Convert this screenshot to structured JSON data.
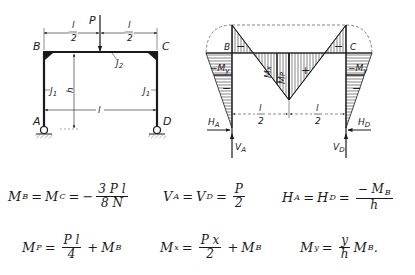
{
  "frame": {
    "labels": {
      "load": "P",
      "corner_left": "B",
      "corner_right": "C",
      "support_left": "A",
      "support_right": "D",
      "half_span_num": "l",
      "half_span_den": "2",
      "beam_inertia": "J",
      "beam_inertia_sub": "2",
      "column_inertia": "J",
      "column_inertia_sub": "1",
      "height": "h",
      "span": "l"
    }
  },
  "moment_diagram": {
    "labels": {
      "corner_left": "B",
      "corner_right": "C",
      "minus": "−",
      "plus": "+",
      "mx": "M",
      "mx_sub": "x",
      "mp": "M",
      "mp_sub": "P",
      "my": "−M",
      "my_sub": "y",
      "half_span_num": "l",
      "half_span_den": "2",
      "ha": "H",
      "ha_sub": "A",
      "hd": "H",
      "hd_sub": "D",
      "va": "V",
      "va_sub": "A",
      "vd": "V",
      "vd_sub": "D"
    }
  },
  "equations": {
    "mb": {
      "lhs1": "M",
      "lhs1_sub": "B",
      "eq1": "=",
      "lhs2": "M",
      "lhs2_sub": "C",
      "eq2": "=",
      "sign": "−",
      "num": "3 P l",
      "den": "8 N"
    },
    "va": {
      "lhs1": "V",
      "lhs1_sub": "A",
      "eq1": "=",
      "lhs2": "V",
      "lhs2_sub": "D",
      "eq2": "=",
      "num": "P",
      "den": "2"
    },
    "ha": {
      "lhs1": "H",
      "lhs1_sub": "A",
      "eq1": "=",
      "lhs2": "H",
      "lhs2_sub": "D",
      "eq2": "=",
      "num": "− M",
      "num_sub": "B",
      "den": "h"
    },
    "mp": {
      "lhs": "M",
      "lhs_sub": "P",
      "eq": "=",
      "num": "P l",
      "den": "4",
      "plus": "+",
      "term": "M",
      "term_sub": "B"
    },
    "mx": {
      "lhs": "M",
      "lhs_sub": "x",
      "eq": "=",
      "num": "P x",
      "den": "2",
      "plus": "+",
      "term": "M",
      "term_sub": "B"
    },
    "my": {
      "lhs": "M",
      "lhs_sub": "y",
      "eq": "=",
      "num": "y",
      "den": "h",
      "term": "M",
      "term_sub": "B",
      "end": "."
    }
  }
}
